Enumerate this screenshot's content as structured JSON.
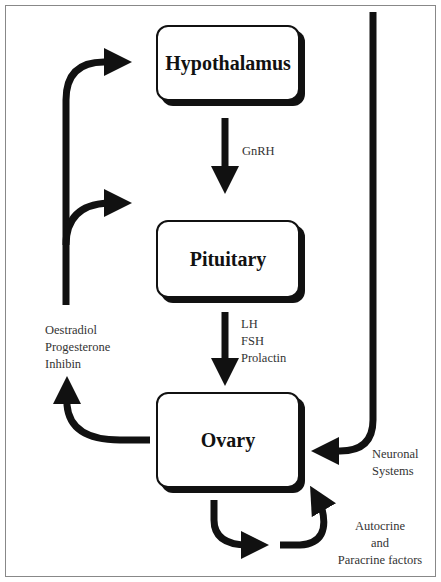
{
  "nodes": {
    "hypothalamus": "Hypothalamus",
    "pituitary": "Pituitary",
    "ovary": "Ovary"
  },
  "labels": {
    "gnrh": "GnRH",
    "pituitary_hormones": [
      "LH",
      "FSH",
      "Prolactin"
    ],
    "ovarian_hormones": [
      "Oestradiol",
      "Progesterone",
      "Inhibin"
    ],
    "neuronal": [
      "Neuronal",
      "Systems"
    ],
    "local": [
      "Autocrine",
      "and",
      "Paracrine factors"
    ]
  }
}
